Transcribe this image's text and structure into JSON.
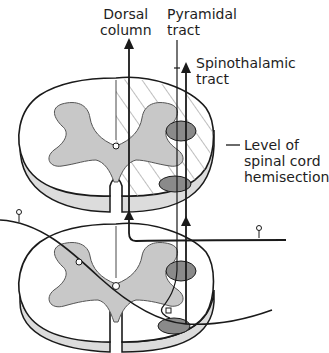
{
  "diagram": {
    "labels": {
      "dorsal_column": "Dorsal\ncolumn",
      "pyramidal_tract": "Pyramidal\ntract",
      "spinothalamic_tract": "Spinothalamic\ntract",
      "hemisection": "Level of\nspinal cord\nhemisection"
    },
    "colors": {
      "outline": "#1a1a1a",
      "grey_matter": "#c8c8c8",
      "tract_dark": "#8a8a8a",
      "hatch": "#9a9a9a",
      "side": "#dcdcdc"
    }
  }
}
